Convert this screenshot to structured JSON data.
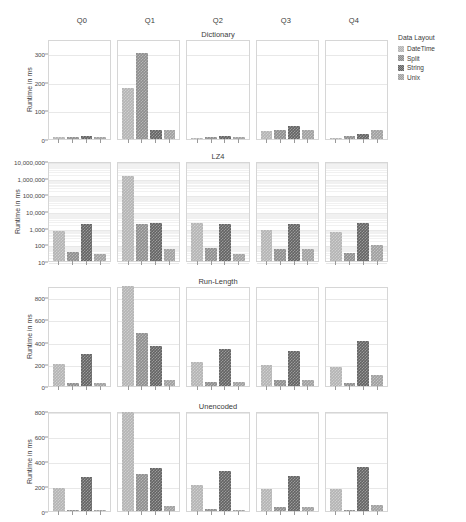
{
  "legend": {
    "title": "Data Layout",
    "entries": [
      {
        "label": "DateTime",
        "key": "dt",
        "color": "#b4b4b4"
      },
      {
        "label": "Split",
        "key": "sp",
        "color": "#8e8e8e"
      },
      {
        "label": "String",
        "key": "st",
        "color": "#636363"
      },
      {
        "label": "Unix",
        "key": "un",
        "color": "#a0a0a0"
      }
    ]
  },
  "columns": [
    "Q0",
    "Q1",
    "Q2",
    "Q3",
    "Q4"
  ],
  "chart_data": {
    "type": "bar",
    "title": "",
    "xlabel": "",
    "ylabel": "Runtime in ms",
    "grid": true,
    "legend_position": "right",
    "legend_title": "Data Layout",
    "series_names": [
      "DateTime",
      "Split",
      "String",
      "Unix"
    ],
    "categories": [
      "Q0",
      "Q1",
      "Q2",
      "Q3",
      "Q4"
    ],
    "facet_rows": [
      "Dictionary",
      "LZ4",
      "Run-Length",
      "Unencoded"
    ],
    "facet_cols": [
      "Q0",
      "Q1",
      "Q2",
      "Q3",
      "Q4"
    ],
    "panels": [
      {
        "row": "Dictionary",
        "scale": "linear",
        "ylim": [
          0,
          350
        ],
        "yticks": [
          0,
          100,
          200,
          300
        ],
        "ytick_labels": [
          "0",
          "100",
          "200",
          "300"
        ],
        "ylabel": "Runtime in ms",
        "data": {
          "Q0": {
            "DateTime": 6,
            "Split": 7,
            "String": 9,
            "Unix": 7
          },
          "Q1": {
            "DateTime": 178,
            "Split": 302,
            "String": 32,
            "Unix": 33
          },
          "Q2": {
            "DateTime": 5,
            "Split": 8,
            "String": 9,
            "Unix": 7
          },
          "Q3": {
            "DateTime": 28,
            "Split": 30,
            "String": 47,
            "Unix": 31
          },
          "Q4": {
            "DateTime": 3,
            "Split": 11,
            "String": 19,
            "Unix": 33
          }
        }
      },
      {
        "row": "LZ4",
        "scale": "log",
        "ylim": [
          10,
          10000000
        ],
        "yticks": [
          10,
          100,
          1000,
          10000,
          100000,
          1000000,
          10000000
        ],
        "ytick_labels": [
          "10",
          "100",
          "1,000",
          "10,000",
          "100,000",
          "1,000,000",
          "10,000,000"
        ],
        "ylabel": "Runtime in ms",
        "data": {
          "Q0": {
            "DateTime": 600,
            "Split": 33,
            "String": 1700,
            "Unix": 25
          },
          "Q1": {
            "DateTime": 1300000,
            "Split": 1600,
            "String": 1800,
            "Unix": 55
          },
          "Q2": {
            "DateTime": 2000,
            "Split": 60,
            "String": 1700,
            "Unix": 28
          },
          "Q3": {
            "DateTime": 750,
            "Split": 55,
            "String": 1650,
            "Unix": 55
          },
          "Q4": {
            "DateTime": 570,
            "Split": 30,
            "String": 1950,
            "Unix": 95
          }
        }
      },
      {
        "row": "Run-Length",
        "scale": "linear",
        "ylim": [
          0,
          900
        ],
        "yticks": [
          0,
          200,
          400,
          600,
          800
        ],
        "ytick_labels": [
          "0",
          "200",
          "400",
          "600",
          "800"
        ],
        "ylabel": "Runtime in ms",
        "data": {
          "Q0": {
            "DateTime": 196,
            "Split": 25,
            "String": 288,
            "Unix": 31
          },
          "Q1": {
            "DateTime": 900,
            "Split": 475,
            "String": 363,
            "Unix": 52
          },
          "Q2": {
            "DateTime": 215,
            "Split": 38,
            "String": 337,
            "Unix": 33
          },
          "Q3": {
            "DateTime": 192,
            "Split": 50,
            "String": 313,
            "Unix": 55
          },
          "Q4": {
            "DateTime": 170,
            "Split": 25,
            "String": 407,
            "Unix": 100
          }
        }
      },
      {
        "row": "Unencoded",
        "scale": "linear",
        "ylim": [
          0,
          800
        ],
        "yticks": [
          0,
          200,
          400,
          600,
          800
        ],
        "ytick_labels": [
          "0",
          "200",
          "400",
          "600",
          "800"
        ],
        "ylabel": "Runtime in ms",
        "data": {
          "Q0": {
            "DateTime": 183,
            "Split": 6,
            "String": 271,
            "Unix": 10
          },
          "Q1": {
            "DateTime": 790,
            "Split": 295,
            "String": 348,
            "Unix": 38
          },
          "Q2": {
            "DateTime": 207,
            "Split": 14,
            "String": 318,
            "Unix": 12
          },
          "Q3": {
            "DateTime": 173,
            "Split": 33,
            "String": 280,
            "Unix": 36
          },
          "Q4": {
            "DateTime": 178,
            "Split": 12,
            "String": 350,
            "Unix": 47
          }
        }
      }
    ]
  }
}
